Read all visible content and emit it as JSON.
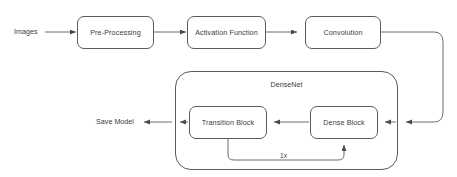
{
  "diagram": {
    "stroke_color": "#5b5b5b",
    "text_color": "#3c3c3c",
    "background": "#ffffff",
    "input_label": "Images",
    "output_label": "Save Model",
    "nodes": [
      {
        "id": "pre-processing",
        "label": "Pre-Processing"
      },
      {
        "id": "activation-function",
        "label": "Activation Function"
      },
      {
        "id": "convolution",
        "label": "Convolution"
      },
      {
        "id": "transition-block",
        "label": "Transition Block"
      },
      {
        "id": "dense-block",
        "label": "Dense Block"
      }
    ],
    "group": {
      "id": "densenet",
      "label": "DenseNet"
    },
    "loop": {
      "label": "1x",
      "from": "transition-block",
      "to": "dense-block"
    }
  }
}
